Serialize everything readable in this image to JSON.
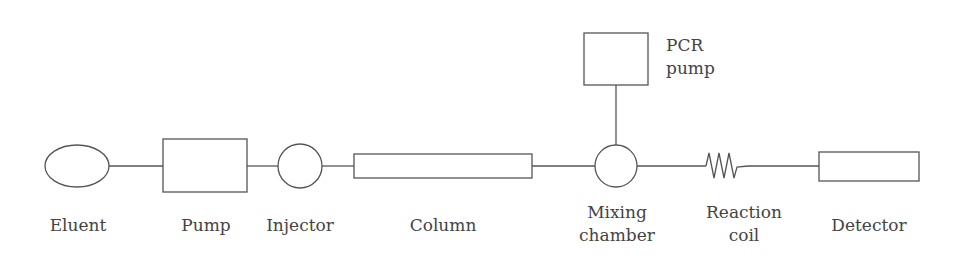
{
  "diagram": {
    "type": "flow-schematic",
    "title": "",
    "colors": {
      "stroke": "#555555",
      "text": "#444444",
      "background": "#ffffff"
    },
    "components": [
      {
        "id": "eluent",
        "label": "Eluent",
        "shape": "ellipse"
      },
      {
        "id": "pump",
        "label": "Pump",
        "shape": "rectangle"
      },
      {
        "id": "injector",
        "label": "Injector",
        "shape": "circle"
      },
      {
        "id": "column",
        "label": "Column",
        "shape": "long-rectangle"
      },
      {
        "id": "mixing_chamber",
        "label_line1": "Mixing",
        "label_line2": "chamber",
        "shape": "circle"
      },
      {
        "id": "reaction_coil",
        "label_line1": "Reaction",
        "label_line2": "coil",
        "shape": "zigzag-coil"
      },
      {
        "id": "detector",
        "label": "Detector",
        "shape": "rectangle"
      },
      {
        "id": "pcr_pump",
        "label_line1": "PCR",
        "label_line2": "pump",
        "shape": "rectangle"
      }
    ],
    "connections": [
      [
        "eluent",
        "pump"
      ],
      [
        "pump",
        "injector"
      ],
      [
        "injector",
        "column"
      ],
      [
        "column",
        "mixing_chamber"
      ],
      [
        "pcr_pump",
        "mixing_chamber"
      ],
      [
        "mixing_chamber",
        "reaction_coil"
      ],
      [
        "reaction_coil",
        "detector"
      ]
    ]
  }
}
